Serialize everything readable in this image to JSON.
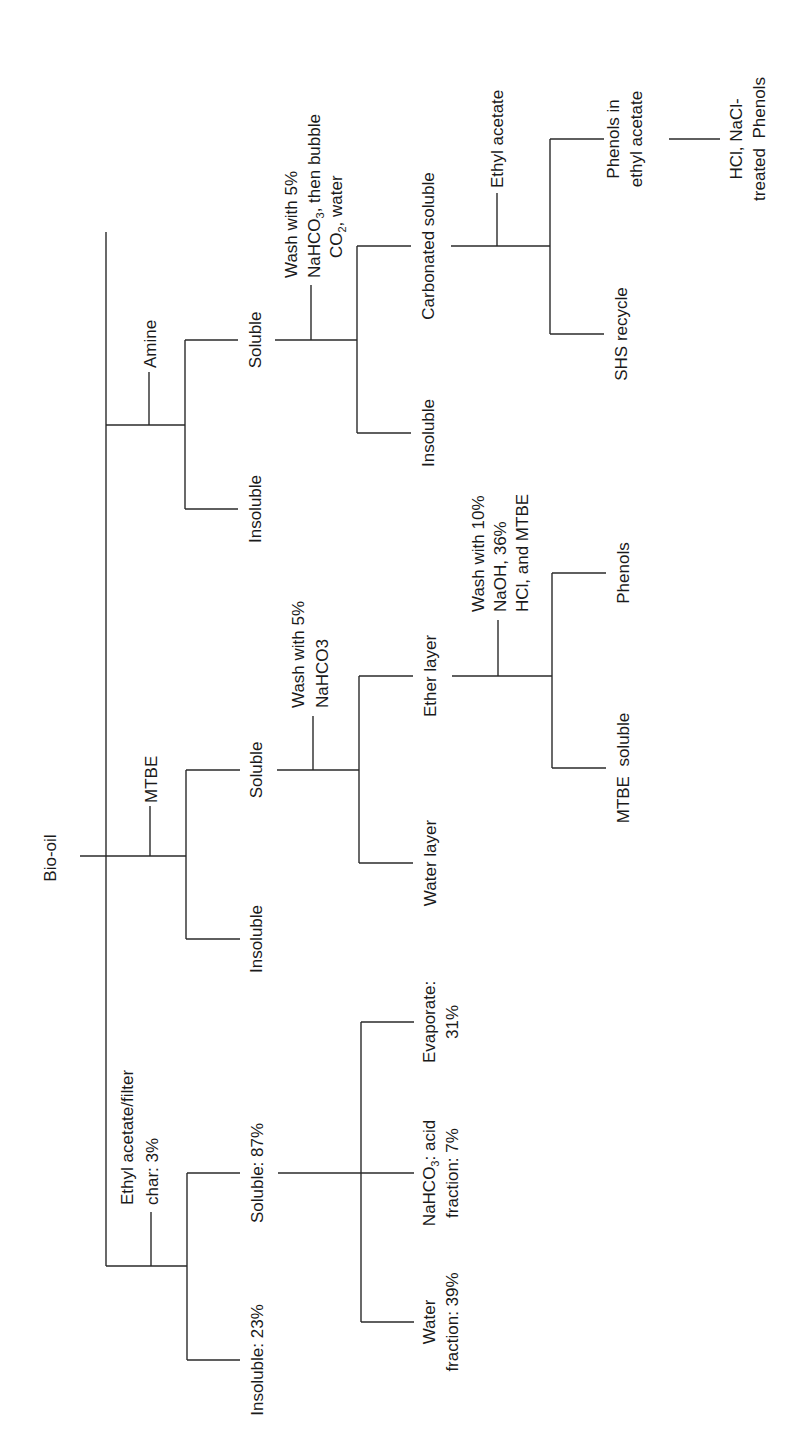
{
  "diagram": {
    "type": "flowchart-tree",
    "orientation": "rotated-90-ccw",
    "root": "Bio-oil",
    "branches": [
      {
        "solvent": "Ethyl acetate/filter",
        "solvent_line2": "char: 3%",
        "insoluble": "Insoluble: 23%",
        "soluble": "Soluble: 87%",
        "children": [
          {
            "line1": "Water",
            "line2": "fraction: 39%"
          },
          {
            "line1": "NaHCO",
            "line1_sub": "3",
            "line1_tail": ": acid",
            "line2": "fraction: 7%"
          },
          {
            "line1": "Evaporate:",
            "line2": "31%"
          }
        ]
      },
      {
        "solvent": "MTBE",
        "insoluble": "Insoluble",
        "soluble": "Soluble",
        "wash": {
          "line1": "Wash with 5%",
          "line2": "NaHCO3"
        },
        "layers": {
          "water": "Water layer",
          "ether": "Ether layer",
          "ether_wash": {
            "line1": "Wash with 10%",
            "line2": "NaOH, 36%",
            "line3": "HCl, and MTBE"
          },
          "ether_children": [
            "MTBE  soluble",
            "Phenols"
          ]
        }
      },
      {
        "solvent": "Amine",
        "insoluble": "Insoluble",
        "soluble": "Soluble",
        "wash": {
          "line1": "Wash with 5%",
          "line2_a": "NaHCO",
          "line2_sub": "3",
          "line2_b": ", then bubble",
          "line3_a": "CO",
          "line3_sub": "2",
          "line3_b": ", water"
        },
        "carbonated": {
          "insoluble": "Insoluble",
          "soluble": "Carbonated soluble",
          "solvent": "Ethyl acetate",
          "children": {
            "recycle": "SHS recycle",
            "phenols_line1": "Phenols in",
            "phenols_line2": "ethyl acetate",
            "final_line1": "HCl, NaCl-",
            "final_line2": "treated  Phenols"
          }
        }
      }
    ]
  }
}
